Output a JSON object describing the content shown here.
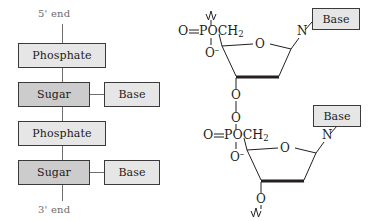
{
  "figure": {
    "background_color": "#ffffff",
    "ink_color": "#231f20",
    "muted_color": "#6b6b6b"
  },
  "left_panel": {
    "name": "schematic-backbone-chain",
    "top_end_label": "5' end",
    "bottom_end_label": "3' end",
    "box_colors": {
      "phosphate_fill": "#e6e6e6",
      "sugar_fill": "#cccccc",
      "base_fill": "#e6e6e6",
      "border": "#3a3a3a",
      "shadow": "#000000"
    },
    "units": [
      {
        "phosphate_label": "Phosphate",
        "sugar_label": "Sugar",
        "base_label": "Base"
      },
      {
        "phosphate_label": "Phosphate",
        "sugar_label": "Sugar",
        "base_label": "Base"
      }
    ]
  },
  "right_panel": {
    "name": "nucleotide-chemical-structure",
    "nucleotides": [
      {
        "id": "upper-nucleotide",
        "phosphate_double_bond_oxygen": "O",
        "double_bond_symbol": "=",
        "phosphorus_group": "POCH",
        "phosphorus_group_subscript": "2",
        "anionic_oxygen": "O",
        "anionic_oxygen_charge": "–",
        "ring_oxygen": "O",
        "glycosidic_nitrogen": "N",
        "base_label": "Base",
        "three_prime_oxygen": "O",
        "top_bond_style": "squiggle",
        "bottom_bond_style": "line-to-next-phosphate"
      },
      {
        "id": "lower-nucleotide",
        "bridging_oxygen": "O",
        "phosphate_double_bond_oxygen": "O",
        "double_bond_symbol": "=",
        "phosphorus_group": "POCH",
        "phosphorus_group_subscript": "2",
        "anionic_oxygen": "O",
        "anionic_oxygen_charge": "–",
        "ring_oxygen": "O",
        "glycosidic_nitrogen": "N",
        "base_label": "Base",
        "three_prime_oxygen": "O",
        "bottom_bond_style": "squiggle"
      }
    ]
  }
}
